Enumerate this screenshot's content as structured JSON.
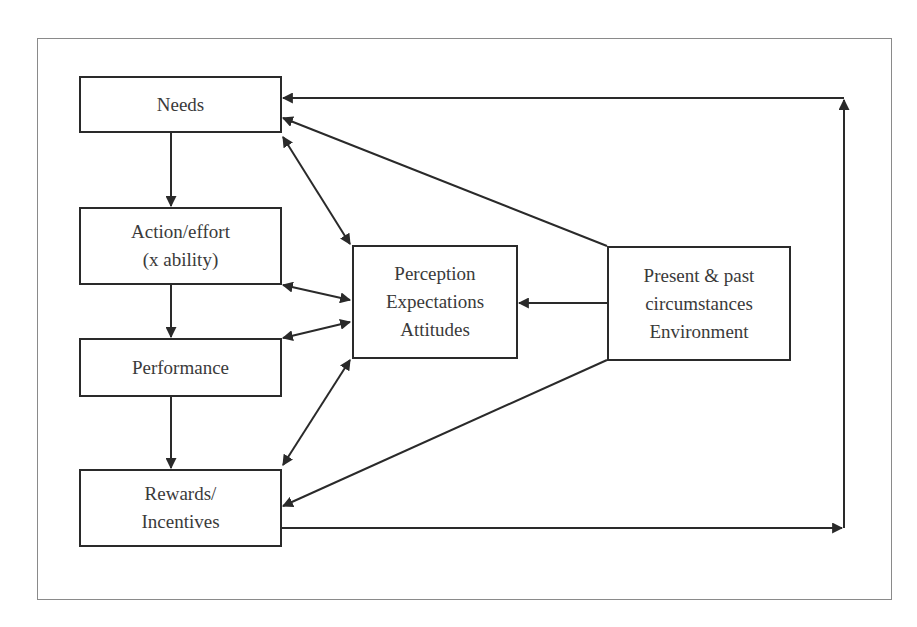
{
  "diagram": {
    "nodes": {
      "needs": {
        "lines": [
          "Needs"
        ]
      },
      "action": {
        "lines": [
          "Action/effort",
          "(x ability)"
        ]
      },
      "performance": {
        "lines": [
          "Performance"
        ]
      },
      "rewards": {
        "lines": [
          "Rewards/",
          "Incentives"
        ]
      },
      "perception": {
        "lines": [
          "Perception",
          "Expectations",
          "Attitudes"
        ]
      },
      "circumstances": {
        "lines": [
          "Present & past",
          "circumstances",
          "Environment"
        ]
      }
    },
    "edges": [
      {
        "from": "needs",
        "to": "action",
        "type": "one-way"
      },
      {
        "from": "action",
        "to": "performance",
        "type": "one-way"
      },
      {
        "from": "performance",
        "to": "rewards",
        "type": "one-way"
      },
      {
        "from": "needs",
        "to": "perception",
        "type": "two-way"
      },
      {
        "from": "action",
        "to": "perception",
        "type": "two-way"
      },
      {
        "from": "performance",
        "to": "perception",
        "type": "two-way"
      },
      {
        "from": "rewards",
        "to": "perception",
        "type": "two-way"
      },
      {
        "from": "circumstances",
        "to": "perception",
        "type": "one-way"
      },
      {
        "from": "circumstances",
        "to": "needs",
        "type": "one-way"
      },
      {
        "from": "circumstances",
        "to": "rewards",
        "type": "one-way"
      },
      {
        "from": "rewards",
        "to": "needs",
        "type": "feedback-loop"
      }
    ],
    "colors": {
      "line": "#2a2a2a",
      "text": "#3a3a3a",
      "frame": "#8a8a8a"
    }
  }
}
